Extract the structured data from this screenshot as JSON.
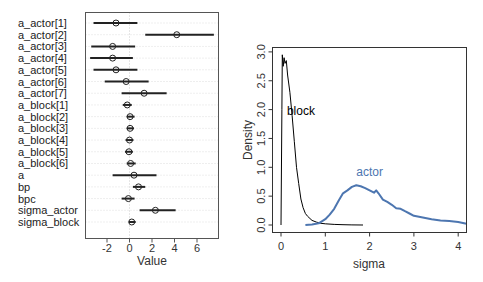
{
  "chart_data": [
    {
      "type": "scatter",
      "subtype": "coefficient-interval-plot",
      "title": "",
      "xlabel": "Value",
      "ylabel": "",
      "xlim": [
        -3.9,
        8.0
      ],
      "xticks": [
        -2,
        0,
        2,
        4,
        6
      ],
      "xtick_labels": [
        "-2",
        "0",
        "2",
        "4",
        "6"
      ],
      "grid": "horizontal dotted at each row, vertical dotted at 0",
      "parameters": [
        {
          "name": "a_actor[1]",
          "mean": -1.2,
          "lower": -3.2,
          "upper": 0.7
        },
        {
          "name": "a_actor[2]",
          "mean": 4.2,
          "lower": 1.4,
          "upper": 7.5
        },
        {
          "name": "a_actor[3]",
          "mean": -1.5,
          "lower": -3.4,
          "upper": 0.5
        },
        {
          "name": "a_actor[4]",
          "mean": -1.5,
          "lower": -3.5,
          "upper": 0.3
        },
        {
          "name": "a_actor[5]",
          "mean": -1.2,
          "lower": -3.2,
          "upper": 0.7
        },
        {
          "name": "a_actor[6]",
          "mean": -0.3,
          "lower": -2.2,
          "upper": 1.7
        },
        {
          "name": "a_actor[7]",
          "mean": 1.3,
          "lower": -0.7,
          "upper": 3.3
        },
        {
          "name": "a_block[1]",
          "mean": -0.2,
          "lower": -0.6,
          "upper": 0.2
        },
        {
          "name": "a_block[2]",
          "mean": 0.05,
          "lower": -0.25,
          "upper": 0.45
        },
        {
          "name": "a_block[3]",
          "mean": 0.05,
          "lower": -0.25,
          "upper": 0.4
        },
        {
          "name": "a_block[4]",
          "mean": 0.0,
          "lower": -0.35,
          "upper": 0.35
        },
        {
          "name": "a_block[5]",
          "mean": -0.05,
          "lower": -0.4,
          "upper": 0.3
        },
        {
          "name": "a_block[6]",
          "mean": 0.1,
          "lower": -0.25,
          "upper": 0.55
        },
        {
          "name": "a",
          "mean": 0.4,
          "lower": -1.5,
          "upper": 2.4
        },
        {
          "name": "bp",
          "mean": 0.8,
          "lower": 0.3,
          "upper": 1.4
        },
        {
          "name": "bpc",
          "mean": -0.1,
          "lower": -0.7,
          "upper": 0.45
        },
        {
          "name": "sigma_actor",
          "mean": 2.3,
          "lower": 0.9,
          "upper": 4.1
        },
        {
          "name": "sigma_block",
          "mean": 0.2,
          "lower": -0.05,
          "upper": 0.55
        }
      ]
    },
    {
      "type": "line",
      "subtype": "density",
      "title": "",
      "xlabel": "sigma",
      "ylabel": "Density",
      "xlim": [
        -0.2,
        4.2
      ],
      "ylim": [
        -0.1,
        3.1
      ],
      "xticks": [
        0,
        1,
        2,
        3,
        4
      ],
      "xtick_labels": [
        "0",
        "1",
        "2",
        "3",
        "4"
      ],
      "yticks": [
        0.0,
        0.5,
        1.0,
        1.5,
        2.0,
        2.5,
        3.0
      ],
      "ytick_labels": [
        "0.0",
        "0.5",
        "1.0",
        "1.5",
        "2.0",
        "2.5",
        "3.0"
      ],
      "grid": false,
      "annotations": [
        {
          "text": "block",
          "x": 0.45,
          "y": 1.9,
          "color": "#000000"
        },
        {
          "text": "actor",
          "x": 2.0,
          "y": 0.85,
          "color": "#4d76b0"
        }
      ],
      "series": [
        {
          "name": "block",
          "color": "#000000",
          "x": [
            0.0,
            0.02,
            0.03,
            0.05,
            0.07,
            0.09,
            0.12,
            0.15,
            0.2,
            0.25,
            0.3,
            0.35,
            0.4,
            0.45,
            0.5,
            0.55,
            0.6,
            0.7,
            0.8,
            0.9,
            1.0,
            1.2,
            1.4,
            1.6,
            1.85
          ],
          "y": [
            0.0,
            2.0,
            2.95,
            2.75,
            2.9,
            2.8,
            2.85,
            2.6,
            2.3,
            1.9,
            1.45,
            1.0,
            0.72,
            0.45,
            0.3,
            0.2,
            0.15,
            0.08,
            0.05,
            0.03,
            0.02,
            0.01,
            0.005,
            0.002,
            0.0
          ]
        },
        {
          "name": "actor",
          "color": "#4d76b0",
          "x": [
            0.55,
            0.7,
            0.85,
            1.0,
            1.1,
            1.2,
            1.3,
            1.4,
            1.5,
            1.6,
            1.7,
            1.8,
            1.9,
            2.0,
            2.1,
            2.15,
            2.2,
            2.3,
            2.4,
            2.5,
            2.6,
            2.7,
            2.8,
            2.9,
            3.0,
            3.2,
            3.4,
            3.6,
            3.8,
            4.0,
            4.2
          ],
          "y": [
            0.0,
            0.01,
            0.03,
            0.1,
            0.18,
            0.28,
            0.42,
            0.55,
            0.6,
            0.66,
            0.69,
            0.67,
            0.64,
            0.6,
            0.56,
            0.6,
            0.55,
            0.44,
            0.4,
            0.35,
            0.29,
            0.28,
            0.24,
            0.2,
            0.16,
            0.13,
            0.1,
            0.08,
            0.07,
            0.05,
            0.02
          ]
        }
      ]
    }
  ]
}
